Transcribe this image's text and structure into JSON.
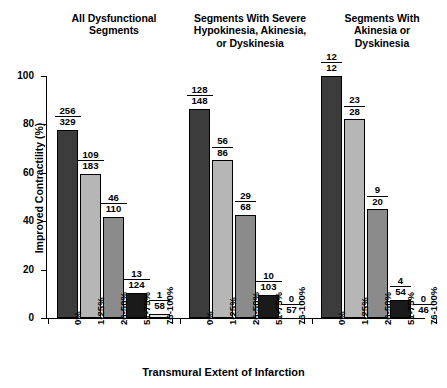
{
  "chart_data": {
    "type": "bar",
    "title": "",
    "xlabel": "Transmural Extent of Infarction",
    "ylabel": "Improved Contractility (%)",
    "ylim": [
      0,
      100
    ],
    "yticks": [
      0,
      20,
      40,
      60,
      80,
      100
    ],
    "grid": false,
    "legend": "none",
    "categories": [
      "0%",
      "1-25%",
      "26-50%",
      "51-75%",
      "76-100%"
    ],
    "panels": [
      {
        "title": "All Dysfunctional Segments",
        "title_lines": [
          "All Dysfunctional",
          "Segments"
        ],
        "values": [
          77.8,
          59.6,
          41.8,
          10.5,
          1.7
        ],
        "numerators": [
          256,
          109,
          46,
          13,
          1
        ],
        "denominators": [
          329,
          183,
          110,
          124,
          58
        ],
        "labels": [
          "256/329",
          "109/183",
          "46/110",
          "13/124",
          "1/58"
        ]
      },
      {
        "title": "Segments With Severe Hypokinesia, Akinesia, or Dyskinesia",
        "title_lines": [
          "Segments With Severe",
          "Hypokinesia, Akinesia,",
          "or Dyskinesia"
        ],
        "values": [
          86.5,
          65.1,
          42.6,
          9.7,
          0.0
        ],
        "numerators": [
          128,
          56,
          29,
          10,
          0
        ],
        "denominators": [
          148,
          86,
          68,
          103,
          57
        ],
        "labels": [
          "128/148",
          "56/86",
          "29/68",
          "10/103",
          "0/57"
        ]
      },
      {
        "title": "Segments With Akinesia or Dyskinesia",
        "title_lines": [
          "Segments With",
          "Akinesia or",
          "Dyskinesia"
        ],
        "values": [
          100.0,
          82.1,
          45.0,
          7.4,
          0.0
        ],
        "numerators": [
          12,
          23,
          9,
          4,
          0
        ],
        "denominators": [
          12,
          28,
          20,
          54,
          46
        ],
        "labels": [
          "12/12",
          "23/28",
          "9/20",
          "4/54",
          "0/46"
        ]
      }
    ],
    "bar_colors": [
      "#3c3c3c",
      "#b6b6b6",
      "#8b8b8b",
      "#1a1a1a",
      "#e3e3e3"
    ],
    "bar_border": "#000000"
  }
}
